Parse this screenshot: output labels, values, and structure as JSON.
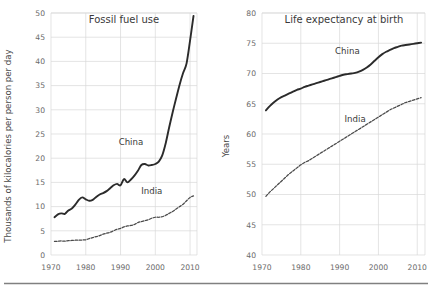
{
  "figure": {
    "background_color": "#ffffff",
    "grid_color": "#d8d8d8",
    "solid_series_color": "#2b2b2b",
    "dashed_series_color": "#4a4a4a",
    "footer_rule_color": "#808080"
  },
  "chart_data": [
    {
      "type": "line",
      "title": "Fossil fuel use",
      "xlabel": "",
      "ylabel": "Thousands of kilocalories per person per day",
      "xlim": [
        1970,
        2012
      ],
      "ylim": [
        0,
        50
      ],
      "grid": true,
      "legend_position": "inline-annotation",
      "xticks": [
        1970,
        1980,
        1990,
        2000,
        2010
      ],
      "yticks": [
        0,
        5,
        10,
        15,
        20,
        25,
        30,
        35,
        40,
        45,
        50
      ],
      "xtick_labels": [
        "1970",
        "1980",
        "1990",
        "2000",
        "2010"
      ],
      "ytick_labels": [
        "0",
        "5",
        "10",
        "15",
        "20",
        "25",
        "30",
        "35",
        "40",
        "45",
        "50"
      ],
      "series": [
        {
          "name": "China",
          "style": "solid",
          "label_x": 1993,
          "label_y": 22.8,
          "x": [
            1971,
            1972,
            1973,
            1974,
            1975,
            1976,
            1977,
            1978,
            1979,
            1980,
            1981,
            1982,
            1983,
            1984,
            1985,
            1986,
            1987,
            1988,
            1989,
            1990,
            1991,
            1992,
            1993,
            1994,
            1995,
            1996,
            1997,
            1998,
            1999,
            2000,
            2001,
            2002,
            2003,
            2004,
            2005,
            2006,
            2007,
            2008,
            2009,
            2010,
            2011
          ],
          "values": [
            7.8,
            8.4,
            8.6,
            8.5,
            9.2,
            9.6,
            10.4,
            11.4,
            11.9,
            11.5,
            11.2,
            11.4,
            12.0,
            12.5,
            12.8,
            13.2,
            13.8,
            14.4,
            14.7,
            14.4,
            15.7,
            15.0,
            15.6,
            16.4,
            17.4,
            18.6,
            18.8,
            18.5,
            18.6,
            18.8,
            19.3,
            20.6,
            23.1,
            26.4,
            29.5,
            32.4,
            35.2,
            37.6,
            39.6,
            44.3,
            49.4
          ]
        },
        {
          "name": "India",
          "style": "dashed",
          "label_x": 1999,
          "label_y": 12.6,
          "x": [
            1971,
            1972,
            1973,
            1974,
            1975,
            1976,
            1977,
            1978,
            1979,
            1980,
            1981,
            1982,
            1983,
            1984,
            1985,
            1986,
            1987,
            1988,
            1989,
            1990,
            1991,
            1992,
            1993,
            1994,
            1995,
            1996,
            1997,
            1998,
            1999,
            2000,
            2001,
            2002,
            2003,
            2004,
            2005,
            2006,
            2007,
            2008,
            2009,
            2010,
            2011
          ],
          "values": [
            2.8,
            2.85,
            2.9,
            2.85,
            2.95,
            3.0,
            3.05,
            3.05,
            3.1,
            3.15,
            3.4,
            3.6,
            3.8,
            4.0,
            4.3,
            4.5,
            4.7,
            5.0,
            5.3,
            5.5,
            5.8,
            6.0,
            6.1,
            6.3,
            6.7,
            6.9,
            7.1,
            7.3,
            7.6,
            7.8,
            7.8,
            7.9,
            8.2,
            8.6,
            9.0,
            9.5,
            10.0,
            10.5,
            11.2,
            11.9,
            12.2
          ]
        }
      ]
    },
    {
      "type": "line",
      "title": "Life expectancy at birth",
      "xlabel": "",
      "ylabel": "Years",
      "xlim": [
        1970,
        2012
      ],
      "ylim": [
        40,
        80
      ],
      "grid": true,
      "legend_position": "inline-annotation",
      "xticks": [
        1970,
        1980,
        1990,
        2000,
        2010
      ],
      "yticks": [
        40,
        45,
        50,
        55,
        60,
        65,
        70,
        75,
        80
      ],
      "xtick_labels": [
        "1970",
        "1980",
        "1990",
        "2000",
        "2010"
      ],
      "ytick_labels": [
        "40",
        "45",
        "50",
        "55",
        "60",
        "65",
        "70",
        "75",
        "80"
      ],
      "series": [
        {
          "name": "China",
          "style": "solid",
          "label_x": 1992,
          "label_y": 73.2,
          "x": [
            1971,
            1972,
            1973,
            1974,
            1975,
            1976,
            1977,
            1978,
            1979,
            1980,
            1981,
            1982,
            1983,
            1984,
            1985,
            1986,
            1987,
            1988,
            1989,
            1990,
            1991,
            1992,
            1993,
            1994,
            1995,
            1996,
            1997,
            1998,
            1999,
            2000,
            2001,
            2002,
            2003,
            2004,
            2005,
            2006,
            2007,
            2008,
            2009,
            2010,
            2011
          ],
          "values": [
            63.9,
            64.6,
            65.2,
            65.7,
            66.1,
            66.4,
            66.7,
            67.0,
            67.3,
            67.5,
            67.8,
            68.0,
            68.2,
            68.4,
            68.6,
            68.8,
            69.0,
            69.2,
            69.4,
            69.6,
            69.8,
            69.9,
            70.0,
            70.1,
            70.3,
            70.6,
            71.0,
            71.5,
            72.1,
            72.7,
            73.2,
            73.6,
            73.9,
            74.2,
            74.4,
            74.6,
            74.7,
            74.8,
            74.9,
            75.0,
            75.1
          ]
        },
        {
          "name": "India",
          "style": "dashed",
          "label_x": 1994,
          "label_y": 62.0,
          "x": [
            1971,
            1972,
            1973,
            1974,
            1975,
            1976,
            1977,
            1978,
            1979,
            1980,
            1981,
            1982,
            1983,
            1984,
            1985,
            1986,
            1987,
            1988,
            1989,
            1990,
            1991,
            1992,
            1993,
            1994,
            1995,
            1996,
            1997,
            1998,
            1999,
            2000,
            2001,
            2002,
            2003,
            2004,
            2005,
            2006,
            2007,
            2008,
            2009,
            2010,
            2011
          ],
          "values": [
            49.7,
            50.4,
            51.0,
            51.6,
            52.2,
            52.8,
            53.4,
            53.9,
            54.4,
            54.9,
            55.3,
            55.6,
            56.0,
            56.4,
            56.8,
            57.2,
            57.6,
            58.0,
            58.4,
            58.8,
            59.2,
            59.6,
            60.0,
            60.4,
            60.8,
            61.2,
            61.6,
            62.0,
            62.4,
            62.8,
            63.2,
            63.6,
            64.0,
            64.3,
            64.6,
            64.9,
            65.2,
            65.4,
            65.6,
            65.8,
            66.0
          ]
        }
      ]
    }
  ]
}
